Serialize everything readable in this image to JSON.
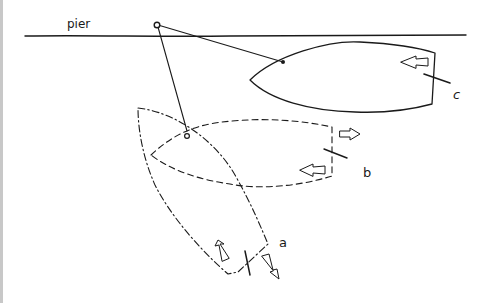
{
  "diagram": {
    "labels": {
      "pier": "pier",
      "a": "a",
      "b": "b",
      "c": "c"
    },
    "elements": {
      "pier_line": "solid horizontal line representing the pier edge",
      "anchor_point": "small circle on the pier where lines are attached",
      "boat_c": "solid-outline boat, bow pointing left, moored parallel to pier",
      "boat_b": "dashed-outline boat, bow pointing left, intermediate position",
      "boat_a": "dash-dot-outline boat, bow pointing up-left, initial position"
    },
    "colors": {
      "ink": "#1a1a1a",
      "background": "#ffffff",
      "border": "#c8c8c8"
    }
  }
}
